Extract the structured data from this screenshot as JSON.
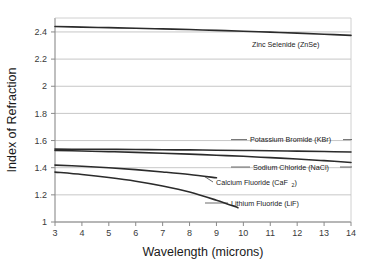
{
  "chart_data": {
    "type": "line",
    "title": "",
    "xlabel": "Wavelength (microns)",
    "ylabel": "Index of Refraction",
    "xlim": [
      3,
      14
    ],
    "ylim": [
      1,
      2.5
    ],
    "xticks": [
      "3",
      "4",
      "5",
      "6",
      "7",
      "8",
      "9",
      "10",
      "11",
      "12",
      "13",
      "14"
    ],
    "yticks": [
      "1",
      "1.2",
      "1.4",
      "1.6",
      "1.8",
      "2",
      "2.2",
      "2.4"
    ],
    "grid": "horizontal",
    "legend": "inline-annotations",
    "line_color": "#2b2b2b",
    "grid_color": "#b8b8b8",
    "axis_color": "#8a8a8a",
    "series": [
      {
        "name": "Zinc Selenide (ZnSe)",
        "label": "Zinc Selenide (ZnSe)",
        "x": [
          3,
          4,
          5,
          6,
          7,
          8,
          9,
          10,
          11,
          12,
          13,
          14
        ],
        "values": [
          2.438,
          2.433,
          2.429,
          2.425,
          2.42,
          2.415,
          2.409,
          2.403,
          2.396,
          2.389,
          2.381,
          2.372
        ]
      },
      {
        "name": "Potassium Bromide (KBr)",
        "label": "Potassium Bromide (KBr)",
        "x": [
          3,
          4,
          5,
          6,
          7,
          8,
          9,
          10,
          11,
          12,
          13,
          14
        ],
        "values": [
          1.536,
          1.535,
          1.534,
          1.533,
          1.531,
          1.53,
          1.528,
          1.526,
          1.524,
          1.521,
          1.518,
          1.515
        ]
      },
      {
        "name": "Sodium Chloride (NaCl)",
        "label": "Sodium Chloride (NaCl)",
        "x": [
          3,
          4,
          5,
          6,
          7,
          8,
          9,
          10,
          11,
          12,
          13,
          14
        ],
        "values": [
          1.526,
          1.522,
          1.517,
          1.512,
          1.506,
          1.499,
          1.491,
          1.483,
          1.473,
          1.463,
          1.451,
          1.438
        ]
      },
      {
        "name": "Calcium Fluoride (CaF2)",
        "label": "Calcium Fluoride (CaF",
        "label_sub": "2",
        "label_tail": ")",
        "x": [
          3,
          4,
          5,
          6,
          7,
          8,
          9
        ],
        "values": [
          1.418,
          1.41,
          1.399,
          1.385,
          1.368,
          1.349,
          1.325
        ]
      },
      {
        "name": "Lithium Fluoride (LiF)",
        "label": "Lithium Fluoride (LiF)",
        "x": [
          3,
          4,
          5,
          6,
          7,
          8,
          9,
          9.8
        ],
        "values": [
          1.367,
          1.349,
          1.327,
          1.3,
          1.265,
          1.221,
          1.16,
          1.105
        ]
      }
    ]
  },
  "annotations": {
    "znse": "Zinc Selenide (ZnSe)",
    "kbr": "Potassium Bromide (KBr)",
    "nacl": "Sodium Chloride (NaCl)",
    "caf2_main": "Calcium Fluoride (CaF",
    "caf2_sub": "2",
    "caf2_tail": ")",
    "lif": "Lithium Fluoride (LiF)"
  }
}
